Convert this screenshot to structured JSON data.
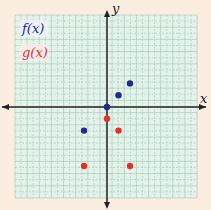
{
  "chart_data": {
    "type": "scatter",
    "title": "",
    "xlabel": "x",
    "ylabel": "y",
    "xlim": [
      -8,
      8
    ],
    "ylim": [
      -8,
      8
    ],
    "grid": true,
    "legend_position": "top-left",
    "series": [
      {
        "name": "f(x)",
        "color": "#1f2a8c",
        "points": [
          [
            0,
            0
          ],
          [
            1,
            1
          ],
          [
            2,
            2
          ],
          [
            -2,
            -2
          ]
        ]
      },
      {
        "name": "g(x)",
        "color": "#e0322a",
        "points": [
          [
            0,
            -1
          ],
          [
            1,
            -2
          ],
          [
            2,
            -5
          ],
          [
            -2,
            -5
          ]
        ]
      }
    ]
  },
  "legend": {
    "f_label": "f(x)",
    "g_label": "g(x)"
  },
  "axes": {
    "x_label": "x",
    "y_label": "y"
  },
  "colors": {
    "background": "#fbeee0",
    "grid_bg": "#e3f3ea",
    "grid_line": "#9ab8a8"
  }
}
